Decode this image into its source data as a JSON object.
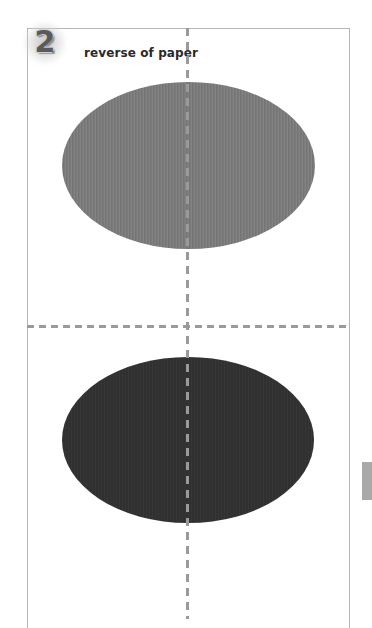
{
  "step": {
    "number": "2",
    "title": "reverse of paper"
  },
  "illustration": {
    "shapes": [
      {
        "name": "top-oval",
        "fill": "#7b7b7b",
        "texture": "vertical-stripes"
      },
      {
        "name": "bottom-oval",
        "fill": "#303030"
      }
    ],
    "fold_lines": {
      "vertical": "dashed",
      "horizontal": "dashed",
      "color": "#9a9a9a"
    }
  },
  "side_tab": {
    "color": "#a9a9a9"
  }
}
